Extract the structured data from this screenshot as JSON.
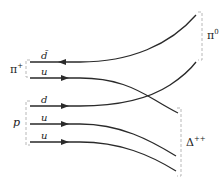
{
  "diagram": {
    "title": "",
    "particles": {
      "pi_plus": {
        "label": "π",
        "sup": "+"
      },
      "pi_zero": {
        "label": "π",
        "sup": "0"
      },
      "proton": {
        "label": "p"
      },
      "delta": {
        "label": "Δ",
        "sup": "++"
      }
    },
    "quark_lines": [
      {
        "label": "d̄",
        "direction": "left",
        "from": "pi_plus",
        "to": "pi_zero"
      },
      {
        "label": "u",
        "direction": "right",
        "from": "pi_plus",
        "to": "delta"
      },
      {
        "label": "d",
        "direction": "right",
        "from": "proton",
        "to": "pi_zero"
      },
      {
        "label": "u",
        "direction": "right",
        "from": "proton",
        "to": "delta"
      },
      {
        "label": "u",
        "direction": "right",
        "from": "proton",
        "to": "delta"
      }
    ],
    "colors": {
      "line": "#2a2a2a",
      "bracket": "#b8b8b8",
      "text": "#222222"
    }
  }
}
